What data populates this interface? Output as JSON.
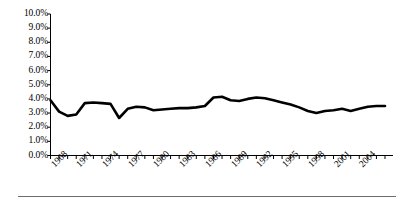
{
  "chart_data": {
    "type": "line",
    "title": "",
    "subtitle": "",
    "xlabel": "",
    "ylabel": "",
    "grid": false,
    "legend_position": "none",
    "line_color": "#000000",
    "axis_color": "#000000",
    "ylim": [
      0,
      10
    ],
    "ytick_labels": [
      "10.0%",
      "9.0%",
      "8.0%",
      "7.0%",
      "6.0%",
      "5.0%",
      "4.0%",
      "3.0%",
      "2.0%",
      "1.0%",
      "0.0%"
    ],
    "ytick_values": [
      10,
      9,
      8,
      7,
      6,
      5,
      4,
      3,
      2,
      1,
      0
    ],
    "xtick_labels": [
      "1968",
      "1971",
      "1974",
      "1977",
      "1980",
      "1983",
      "1986",
      "1989",
      "1992",
      "1995",
      "1998",
      "2001",
      "2004"
    ],
    "xtick_values": [
      1968,
      1971,
      1974,
      1977,
      1980,
      1983,
      1986,
      1989,
      1992,
      1995,
      1998,
      2001,
      2004
    ],
    "xlim": [
      1968,
      2007
    ],
    "x": [
      1968,
      1969,
      1970,
      1971,
      1972,
      1973,
      1974,
      1975,
      1976,
      1977,
      1978,
      1979,
      1980,
      1981,
      1982,
      1983,
      1984,
      1985,
      1986,
      1987,
      1988,
      1989,
      1990,
      1991,
      1992,
      1993,
      1994,
      1995,
      1996,
      1997,
      1998,
      1999,
      2000,
      2001,
      2002,
      2003,
      2004,
      2005,
      2006,
      2007
    ],
    "values": [
      3.9,
      3.1,
      2.8,
      2.9,
      3.7,
      3.75,
      3.7,
      3.65,
      2.65,
      3.3,
      3.45,
      3.4,
      3.2,
      3.25,
      3.3,
      3.35,
      3.35,
      3.4,
      3.5,
      4.1,
      4.15,
      3.9,
      3.85,
      4.0,
      4.1,
      4.05,
      3.9,
      3.75,
      3.6,
      3.4,
      3.15,
      3.0,
      3.15,
      3.2,
      3.3,
      3.15,
      3.3,
      3.45,
      3.5,
      3.5
    ],
    "series": [
      {
        "name": "rate",
        "values": [
          3.9,
          3.1,
          2.8,
          2.9,
          3.7,
          3.75,
          3.7,
          3.65,
          2.65,
          3.3,
          3.45,
          3.4,
          3.2,
          3.25,
          3.3,
          3.35,
          3.35,
          3.4,
          3.5,
          4.1,
          4.15,
          3.9,
          3.85,
          4.0,
          4.1,
          4.05,
          3.9,
          3.75,
          3.6,
          3.4,
          3.15,
          3.0,
          3.15,
          3.2,
          3.3,
          3.15,
          3.3,
          3.45,
          3.5,
          3.5
        ]
      }
    ],
    "annotations": []
  }
}
